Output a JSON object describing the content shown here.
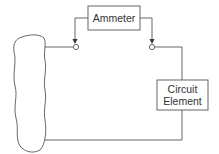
{
  "diagram": {
    "ammeter": {
      "label": "Ammeter"
    },
    "circuit_element": {
      "line1": "Circuit",
      "line2": "Element"
    },
    "colors": {
      "stroke": "#555555",
      "background": "#ffffff"
    }
  }
}
